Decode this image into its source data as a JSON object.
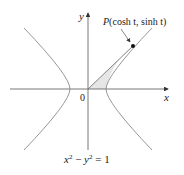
{
  "figure": {
    "axis_x_label": "x",
    "axis_y_label": "y",
    "origin_label": "0",
    "point_label_p": "P",
    "point_label_coords": "(cosh t, sinh t)",
    "equation_x": "x",
    "equation_sup1": "2",
    "equation_minus": " − ",
    "equation_y": "y",
    "equation_sup2": "2",
    "equation_rest": " = 1",
    "colors": {
      "curve": "#8a8a8a",
      "axis": "#555555",
      "shade": "#e6e6e6",
      "point": "#111111"
    }
  }
}
